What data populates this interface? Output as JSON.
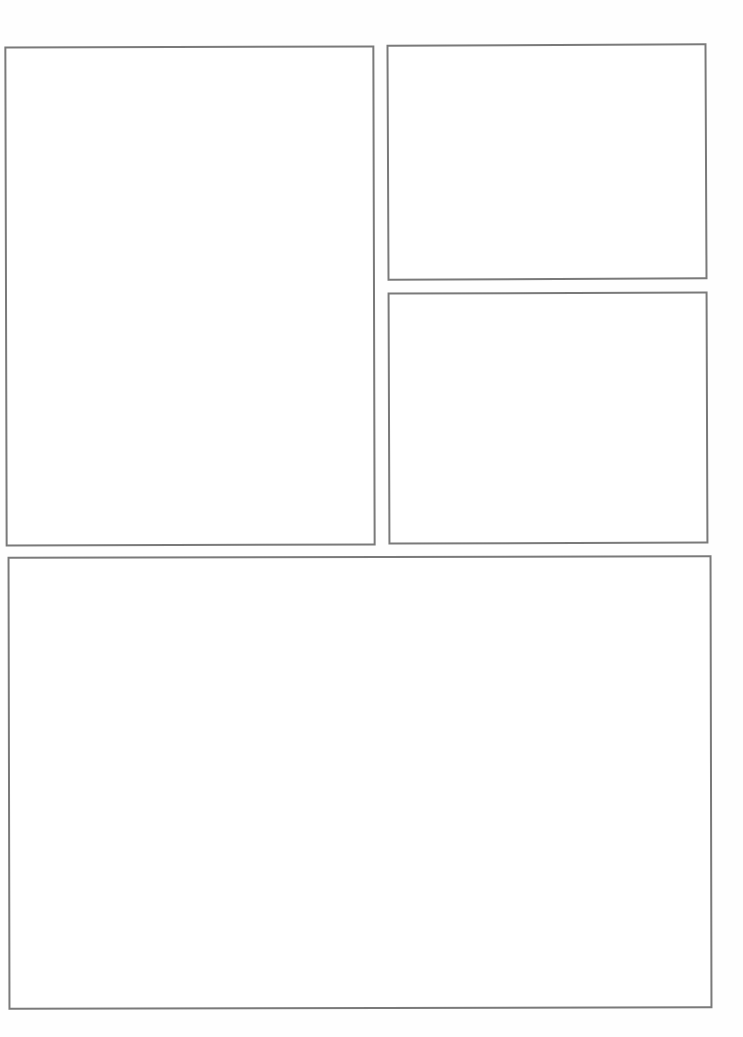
{
  "page": {
    "background_color": "#ffffff",
    "border_color": "#7a7a7a",
    "panels": [
      {
        "id": 1,
        "position": "top-left",
        "content": ""
      },
      {
        "id": 2,
        "position": "top-right",
        "content": ""
      },
      {
        "id": 3,
        "position": "middle-right",
        "content": ""
      },
      {
        "id": 4,
        "position": "bottom",
        "content": ""
      }
    ]
  }
}
